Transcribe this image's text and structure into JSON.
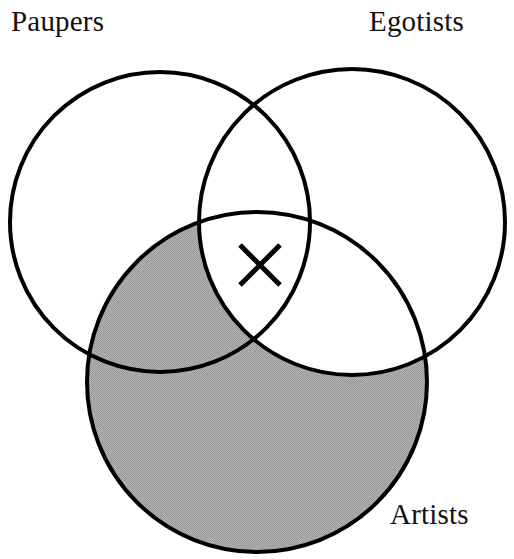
{
  "figure": {
    "background_color": "#ffffff",
    "stroke_color": "#000000",
    "stroke_width": 4,
    "shade_color": "#a8a8a8",
    "shade_pattern": "halftone-dither",
    "width": 514,
    "height": 559
  },
  "sets": {
    "paupers": {
      "label": "Paupers",
      "cx": 160,
      "cy": 222,
      "r": 150,
      "label_x": 11,
      "label_y": 7
    },
    "egotists": {
      "label": "Egotists",
      "cx": 352,
      "cy": 222,
      "r": 153,
      "label_x": 369,
      "label_y": 7
    },
    "artists": {
      "label": "Artists",
      "cx": 257,
      "cy": 382,
      "r": 170,
      "label_x": 390,
      "label_y": 500
    }
  },
  "shaded_region": {
    "description": "Artists minus Egotists",
    "includes": [
      "artists"
    ],
    "excludes": [
      "egotists"
    ],
    "fill": "#a8a8a8"
  },
  "marks": [
    {
      "name": "x-mark",
      "glyph": "X",
      "cx": 260,
      "cy": 265,
      "size": 40,
      "region": "Paupers and Egotists and Artists",
      "color": "#000000"
    }
  ],
  "chart_data": {
    "type": "venn",
    "title": "",
    "sets": [
      "Paupers",
      "Egotists",
      "Artists"
    ],
    "regions": [
      {
        "id": "P",
        "members": [
          "Paupers"
        ],
        "shaded": false,
        "mark": ""
      },
      {
        "id": "E",
        "members": [
          "Egotists"
        ],
        "shaded": false,
        "mark": ""
      },
      {
        "id": "A",
        "members": [
          "Artists"
        ],
        "shaded": true,
        "mark": ""
      },
      {
        "id": "PE",
        "members": [
          "Paupers",
          "Egotists"
        ],
        "shaded": false,
        "mark": ""
      },
      {
        "id": "PA",
        "members": [
          "Paupers",
          "Artists"
        ],
        "shaded": true,
        "mark": ""
      },
      {
        "id": "EA",
        "members": [
          "Egotists",
          "Artists"
        ],
        "shaded": false,
        "mark": ""
      },
      {
        "id": "PEA",
        "members": [
          "Paupers",
          "Egotists",
          "Artists"
        ],
        "shaded": false,
        "mark": "X"
      }
    ],
    "legend": "none",
    "grid": false
  }
}
